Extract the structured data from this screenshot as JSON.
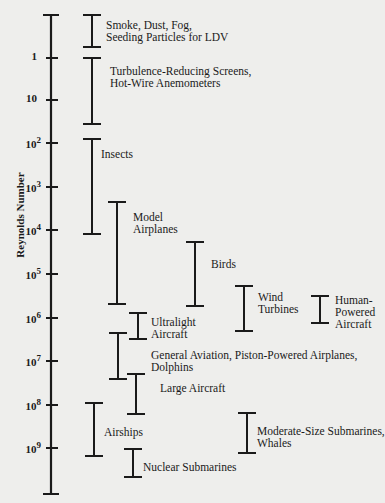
{
  "diagram": {
    "axis_label": "Reynolds Number",
    "axis": {
      "x": 51,
      "top": 15,
      "bottom": 494
    },
    "ticks": [
      {
        "base": "1",
        "exp": "",
        "y": 58
      },
      {
        "base": "10",
        "exp": "",
        "y": 100
      },
      {
        "base": "10",
        "exp": "2",
        "y": 143
      },
      {
        "base": "10",
        "exp": "3",
        "y": 187
      },
      {
        "base": "10",
        "exp": "4",
        "y": 230
      },
      {
        "base": "10",
        "exp": "5",
        "y": 274
      },
      {
        "base": "10",
        "exp": "6",
        "y": 318
      },
      {
        "base": "10",
        "exp": "7",
        "y": 361
      },
      {
        "base": "10",
        "exp": "8",
        "y": 405
      },
      {
        "base": "10",
        "exp": "9",
        "y": 448
      }
    ],
    "ranges": [
      {
        "label": "Smoke, Dust, Fog,\nSeeding Particles for LDV",
        "x": 92,
        "y1": 15,
        "y2": 47,
        "lx": 106,
        "ly": 19
      },
      {
        "label": "Turbulence-Reducing Screens,\nHot-Wire Anemometers",
        "x": 92,
        "y1": 58,
        "y2": 124,
        "lx": 110,
        "ly": 65
      },
      {
        "label": "Insects",
        "x": 92,
        "y1": 139,
        "y2": 234,
        "lx": 101,
        "ly": 148
      },
      {
        "label": "Model\nAirplanes",
        "x": 117,
        "y1": 202,
        "y2": 304,
        "lx": 133,
        "ly": 211
      },
      {
        "label": "Birds",
        "x": 195,
        "y1": 242,
        "y2": 306,
        "lx": 211,
        "ly": 258
      },
      {
        "label": "Wind\nTurbines",
        "x": 244,
        "y1": 286,
        "y2": 331,
        "lx": 258,
        "ly": 291
      },
      {
        "label": "Human-\nPowered\nAircraft",
        "x": 320,
        "y1": 296,
        "y2": 323,
        "lx": 335,
        "ly": 294
      },
      {
        "label": "Ultralight\nAircraft",
        "x": 138,
        "y1": 313,
        "y2": 339,
        "lx": 151,
        "ly": 316
      },
      {
        "label": "General Aviation, Piston-Powered Airplanes,\nDolphins",
        "x": 118,
        "y1": 333,
        "y2": 379,
        "lx": 151,
        "ly": 349
      },
      {
        "label": "Large Aircraft",
        "x": 136,
        "y1": 374,
        "y2": 414,
        "lx": 160,
        "ly": 382
      },
      {
        "label": "Airships",
        "x": 94,
        "y1": 403,
        "y2": 456,
        "lx": 104,
        "ly": 426
      },
      {
        "label": "Moderate-Size Submarines,\nWhales",
        "x": 247,
        "y1": 413,
        "y2": 453,
        "lx": 257,
        "ly": 425
      },
      {
        "label": "Nuclear Submarines",
        "x": 133,
        "y1": 449,
        "y2": 477,
        "lx": 143,
        "ly": 461
      }
    ]
  }
}
